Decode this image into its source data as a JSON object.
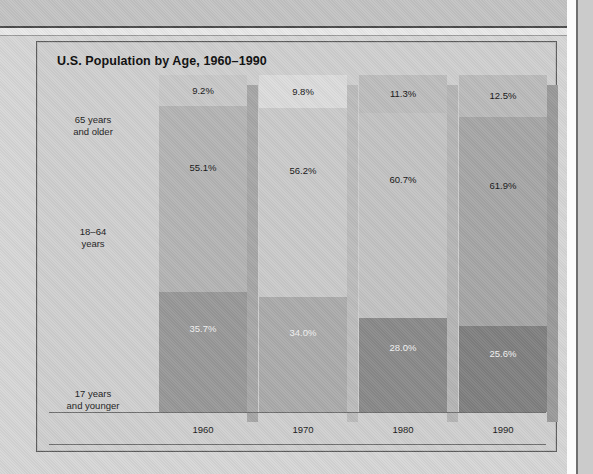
{
  "chart_data": {
    "type": "bar",
    "subtype": "stacked-bar-100-percent",
    "title": "U.S. Population by Age, 1960–1990",
    "categories": [
      "1960",
      "1970",
      "1980",
      "1990"
    ],
    "xlabel": "",
    "ylabel": "",
    "ylim": [
      0,
      100
    ],
    "grid": false,
    "legend_position": "left-row-labels",
    "series": [
      {
        "name": "65 years and older",
        "values": [
          9.2,
          9.8,
          11.3,
          12.5
        ],
        "labels": [
          "9.2%",
          "9.8%",
          "11.3%",
          "12.5%"
        ],
        "color": "#c6c6c6",
        "label_color": "#141414",
        "stack_order": 2
      },
      {
        "name": "18–64 years",
        "values": [
          55.1,
          56.2,
          60.7,
          61.9
        ],
        "labels": [
          "55.1%",
          "56.2%",
          "60.7%",
          "61.9%"
        ],
        "color": "#b0b0b0",
        "label_color": "#141414",
        "stack_order": 1
      },
      {
        "name": "17 years and younger",
        "values": [
          35.7,
          34.0,
          28.0,
          25.6
        ],
        "labels": [
          "35.7%",
          "34.0%",
          "28.0%",
          "25.6%"
        ],
        "color": "#919191",
        "label_color": "#f2f2f2",
        "stack_order": 0
      }
    ],
    "bar_tints": [
      {
        "category": "1960",
        "top": "#c8c8c8",
        "middle": "#b4b4b4",
        "bottom": "#989898"
      },
      {
        "category": "1970",
        "top": "#dcdcdc",
        "middle": "#cacaca",
        "bottom": "#ababab"
      },
      {
        "category": "1980",
        "top": "#bdbdbd",
        "middle": "#c3c3c3",
        "bottom": "#8a8a8a"
      },
      {
        "category": "1990",
        "top": "#bbbbbb",
        "middle": "#a6a6a6",
        "bottom": "#808080"
      }
    ]
  },
  "chart": {
    "title": "U.S. Population by Age, 1960–1990",
    "row_labels": [
      {
        "line1": "65 years",
        "line2": "and older"
      },
      {
        "line1": "18–64",
        "line2": "years"
      },
      {
        "line1": "17 years",
        "line2": "and younger"
      }
    ],
    "year_labels": [
      "1960",
      "1970",
      "1980",
      "1990"
    ],
    "bars": [
      {
        "year": "1960",
        "segments": [
          {
            "label": "9.2%",
            "value": 9.2,
            "tone": "dark"
          },
          {
            "label": "55.1%",
            "value": 55.1,
            "tone": "dark"
          },
          {
            "label": "35.7%",
            "value": 35.7,
            "tone": "light"
          }
        ]
      },
      {
        "year": "1970",
        "segments": [
          {
            "label": "9.8%",
            "value": 9.8,
            "tone": "dark"
          },
          {
            "label": "56.2%",
            "value": 56.2,
            "tone": "dark"
          },
          {
            "label": "34.0%",
            "value": 34.0,
            "tone": "light"
          }
        ]
      },
      {
        "year": "1980",
        "segments": [
          {
            "label": "11.3%",
            "value": 11.3,
            "tone": "dark"
          },
          {
            "label": "60.7%",
            "value": 60.7,
            "tone": "dark"
          },
          {
            "label": "28.0%",
            "value": 28.0,
            "tone": "light"
          }
        ]
      },
      {
        "year": "1990",
        "segments": [
          {
            "label": "12.5%",
            "value": 12.5,
            "tone": "dark"
          },
          {
            "label": "61.9%",
            "value": 61.9,
            "tone": "dark"
          },
          {
            "label": "25.6%",
            "value": 25.6,
            "tone": "light"
          }
        ]
      }
    ]
  },
  "colors": {
    "page_background": "#d6d6d6",
    "frame_background": "#cfcfcf",
    "frame_border": "#5c5c5c",
    "title_text": "#0d0d0d",
    "label_text_dark": "#141414",
    "label_text_light": "#f2f2f2",
    "axis_line": "#6e6e6e",
    "bar_shadow": "#a9a9a9"
  }
}
